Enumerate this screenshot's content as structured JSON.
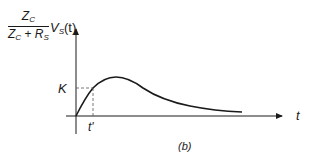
{
  "figure": {
    "caption": "(b)",
    "y_label": {
      "numerator": {
        "base": "Z",
        "sub": "C"
      },
      "denominator": {
        "term1_base": "Z",
        "term1_sub": "C",
        "op": "+",
        "term2_base": "R",
        "term2_sub": "S"
      },
      "multiplier": {
        "base": "V",
        "sub": "S",
        "arg": "(t)"
      }
    },
    "x_label": "t",
    "k_label": "K",
    "tprime_label": "t'"
  },
  "colors": {
    "ink": "#1a1a1a",
    "dash": "#555555"
  }
}
